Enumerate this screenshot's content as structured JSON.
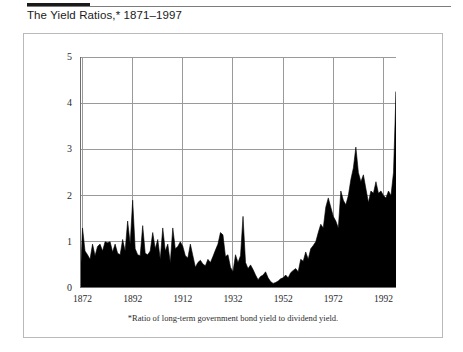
{
  "header": {
    "title": "The Yield Ratios,* 1871–1997"
  },
  "footnote": "*Ratio of long-term government bond yield to dividend yield.",
  "axis": {
    "y_ticks": [
      "0",
      "1",
      "2",
      "3",
      "4",
      "5"
    ],
    "x_ticks": [
      "1872",
      "1892",
      "1912",
      "1932",
      "1952",
      "1972",
      "1992"
    ]
  },
  "colors": {
    "area_fill": "#000000",
    "grid": "#9a9a9a",
    "axis": "#6e6e6e",
    "frame": "#b9b9b9",
    "rule": "#1a1a1a",
    "background": "#ffffff"
  },
  "chart_data": {
    "type": "area",
    "title": "The Yield Ratios,* 1871–1997",
    "subtitle": "",
    "xlabel": "",
    "ylabel": "",
    "xlim": [
      1871,
      1997
    ],
    "ylim": [
      0,
      5
    ],
    "grid": true,
    "legend": null,
    "annotation": "*Ratio of long-term government bond yield to dividend yield.",
    "x_tick_values": [
      1872,
      1892,
      1912,
      1932,
      1952,
      1972,
      1992
    ],
    "y_tick_values": [
      0,
      1,
      2,
      3,
      4,
      5
    ],
    "series": [
      {
        "name": "Ratio of long-term government bond yield to dividend yield",
        "x": [
          1871,
          1872,
          1873,
          1874,
          1875,
          1876,
          1877,
          1878,
          1879,
          1880,
          1881,
          1882,
          1883,
          1884,
          1885,
          1886,
          1887,
          1888,
          1889,
          1890,
          1891,
          1892,
          1893,
          1894,
          1895,
          1896,
          1897,
          1898,
          1899,
          1900,
          1901,
          1902,
          1903,
          1904,
          1905,
          1906,
          1907,
          1908,
          1909,
          1910,
          1911,
          1912,
          1913,
          1914,
          1915,
          1916,
          1917,
          1918,
          1919,
          1920,
          1921,
          1922,
          1923,
          1924,
          1925,
          1926,
          1927,
          1928,
          1929,
          1930,
          1931,
          1932,
          1933,
          1934,
          1935,
          1936,
          1937,
          1938,
          1939,
          1940,
          1941,
          1942,
          1943,
          1944,
          1945,
          1946,
          1947,
          1948,
          1949,
          1950,
          1951,
          1952,
          1953,
          1954,
          1955,
          1956,
          1957,
          1958,
          1959,
          1960,
          1961,
          1962,
          1963,
          1964,
          1965,
          1966,
          1967,
          1968,
          1969,
          1970,
          1971,
          1972,
          1973,
          1974,
          1975,
          1976,
          1977,
          1978,
          1979,
          1980,
          1981,
          1982,
          1983,
          1984,
          1985,
          1986,
          1987,
          1988,
          1989,
          1990,
          1991,
          1992,
          1993,
          1994,
          1995,
          1996,
          1997
        ],
        "values": [
          0.05,
          1.3,
          0.8,
          0.72,
          0.62,
          0.95,
          0.7,
          0.9,
          0.95,
          0.8,
          1.0,
          0.98,
          1.0,
          0.78,
          0.95,
          0.75,
          0.72,
          1.05,
          0.8,
          1.45,
          0.95,
          1.9,
          0.85,
          0.72,
          0.7,
          1.35,
          0.75,
          0.72,
          0.8,
          1.2,
          0.85,
          1.05,
          0.62,
          1.3,
          0.8,
          0.95,
          0.55,
          1.3,
          0.85,
          0.9,
          1.0,
          0.9,
          0.7,
          0.65,
          0.95,
          0.7,
          0.45,
          0.55,
          0.6,
          0.52,
          0.48,
          0.62,
          0.55,
          0.68,
          0.82,
          0.95,
          1.2,
          1.15,
          0.68,
          0.72,
          0.45,
          0.35,
          0.72,
          0.55,
          0.7,
          1.55,
          0.55,
          0.42,
          0.5,
          0.4,
          0.28,
          0.18,
          0.25,
          0.28,
          0.35,
          0.22,
          0.14,
          0.1,
          0.12,
          0.15,
          0.2,
          0.22,
          0.28,
          0.22,
          0.33,
          0.38,
          0.42,
          0.35,
          0.62,
          0.58,
          0.78,
          0.62,
          0.85,
          0.92,
          1.0,
          1.2,
          1.38,
          1.3,
          1.75,
          1.95,
          1.75,
          1.55,
          1.45,
          1.3,
          2.1,
          1.9,
          1.8,
          2.0,
          2.35,
          2.6,
          3.05,
          2.5,
          2.3,
          2.45,
          2.15,
          1.85,
          2.1,
          2.05,
          2.3,
          2.05,
          2.1,
          2.0,
          1.95,
          2.1,
          2.0,
          2.5,
          4.25
        ]
      }
    ]
  }
}
